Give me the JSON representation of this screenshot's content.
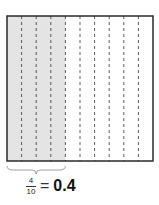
{
  "diagram": {
    "total_parts": 10,
    "shaded_parts": 4,
    "colors": {
      "shaded": "#e4e4e4",
      "unshaded": "#ffffff",
      "border": "#2a2a2a",
      "divider": "#333333"
    },
    "caption": {
      "numerator": "4",
      "denominator": "10",
      "equals": "=",
      "decimal": "0.4"
    }
  }
}
